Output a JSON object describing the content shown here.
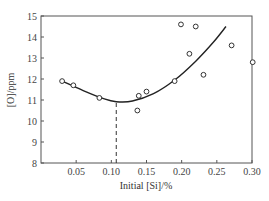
{
  "chart_data": {
    "type": "scatter",
    "title": "",
    "xlabel": "Initial [Si]/%",
    "ylabel": "[O]/ppm",
    "xlim": [
      0,
      0.3
    ],
    "ylim": [
      8,
      15
    ],
    "x_ticks": [
      "0.05",
      "0.10",
      "0.15",
      "0.20",
      "0.25",
      "0.30"
    ],
    "y_ticks": [
      "8",
      "9",
      "10",
      "11",
      "12",
      "13",
      "14",
      "15"
    ],
    "grid": false,
    "legend": null,
    "series": [
      {
        "name": "measured",
        "type": "scatter",
        "marker": "open-circle",
        "points": [
          {
            "x": 0.03,
            "y": 11.9
          },
          {
            "x": 0.046,
            "y": 11.7
          },
          {
            "x": 0.083,
            "y": 11.1
          },
          {
            "x": 0.137,
            "y": 10.5
          },
          {
            "x": 0.139,
            "y": 11.2
          },
          {
            "x": 0.15,
            "y": 11.4
          },
          {
            "x": 0.19,
            "y": 11.9
          },
          {
            "x": 0.199,
            "y": 14.6
          },
          {
            "x": 0.211,
            "y": 13.2
          },
          {
            "x": 0.22,
            "y": 14.5
          },
          {
            "x": 0.231,
            "y": 12.2
          },
          {
            "x": 0.271,
            "y": 13.6
          },
          {
            "x": 0.301,
            "y": 12.8
          }
        ]
      },
      {
        "name": "fit-curve",
        "type": "line",
        "points": [
          {
            "x": 0.03,
            "y": 11.9
          },
          {
            "x": 0.06,
            "y": 11.45
          },
          {
            "x": 0.09,
            "y": 11.05
          },
          {
            "x": 0.107,
            "y": 10.92
          },
          {
            "x": 0.13,
            "y": 10.95
          },
          {
            "x": 0.16,
            "y": 11.3
          },
          {
            "x": 0.19,
            "y": 11.95
          },
          {
            "x": 0.22,
            "y": 12.85
          },
          {
            "x": 0.245,
            "y": 13.75
          },
          {
            "x": 0.263,
            "y": 14.5
          }
        ]
      }
    ],
    "annotations": [
      {
        "type": "dashed-vline",
        "x": 0.107,
        "y_from": 8,
        "y_to": 10.92,
        "note": "curve minimum"
      }
    ]
  }
}
